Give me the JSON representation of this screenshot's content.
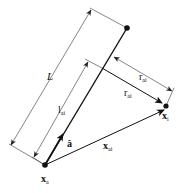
{
  "diagram": {
    "labels": {
      "L": "L",
      "l_ai_main": "l",
      "l_ai_sub": "ai",
      "r_ai_upper_main": "r",
      "r_ai_upper_sub": "ai",
      "r_ai_lower_main": "r",
      "r_ai_lower_sub": "ai",
      "a_hat": "â",
      "x_ai_main": "x",
      "x_ai_sub": "ai",
      "x_a_main": "x",
      "x_a_sub": "a",
      "x_i_main": "x",
      "x_i_sub": "i"
    },
    "points": {
      "x_a": [
        45,
        165
      ],
      "line_end": [
        127,
        28
      ],
      "x_i": [
        166,
        106
      ],
      "foot": [
        102,
        68
      ]
    },
    "colors": {
      "stroke": "#111111",
      "dimension": "#333333",
      "background": "#ffffff"
    }
  }
}
